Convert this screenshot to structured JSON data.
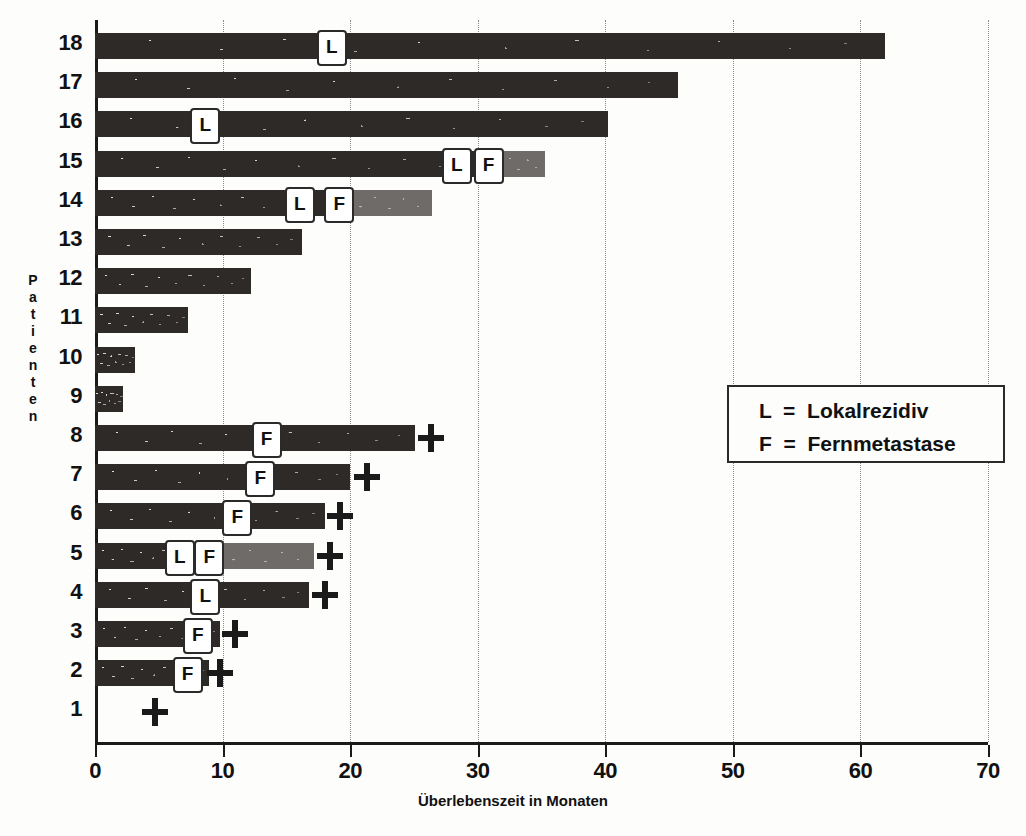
{
  "chart": {
    "type": "bar",
    "title": "",
    "xlabel": "Überlebenszeit in Monaten",
    "ylabel": "Patienten",
    "ylabel_letters": [
      "P",
      "a",
      "t",
      "i",
      "e",
      "n",
      "t",
      "e",
      "n"
    ],
    "xlim": [
      0,
      70
    ],
    "xticks": [
      0,
      10,
      20,
      30,
      40,
      50,
      60,
      70
    ],
    "xtick_labels": [
      "0",
      "10",
      "20",
      "30",
      "40",
      "50",
      "60",
      "70"
    ],
    "grid": "vertical-dotted",
    "legend": {
      "position": "right-middle",
      "entries": [
        {
          "key": "L",
          "equals": "=",
          "label": "Lokalrezidiv",
          "text": "L  =  Lokalrezidiv"
        },
        {
          "key": "F",
          "equals": "=",
          "label": "Fernmetastase",
          "text": "F  =  Fernmetastase"
        }
      ]
    },
    "marker_legend_note": "+ = Tod",
    "categories": [
      "18",
      "17",
      "16",
      "15",
      "14",
      "13",
      "12",
      "11",
      "10",
      "9",
      "8",
      "7",
      "6",
      "5",
      "4",
      "3",
      "2",
      "1"
    ]
  },
  "chart_data": {
    "type": "bar",
    "orientation": "horizontal",
    "title": "",
    "xlabel": "Überlebenszeit in Monaten",
    "ylabel": "Patienten",
    "xlim": [
      0,
      70
    ],
    "categories": [
      "18",
      "17",
      "16",
      "15",
      "14",
      "13",
      "12",
      "11",
      "10",
      "9",
      "8",
      "7",
      "6",
      "5",
      "4",
      "3",
      "2",
      "1"
    ],
    "values": [
      61.9,
      45.7,
      40.2,
      35.3,
      26.4,
      16.2,
      12.2,
      7.3,
      3.1,
      2.2,
      25.1,
      20.0,
      18.0,
      17.2,
      16.8,
      9.8,
      8.9,
      0.0
    ],
    "rows": [
      {
        "patient": "18",
        "label": "18",
        "total": 61.9,
        "dark_end": 61.9,
        "light_end": null,
        "death": null,
        "markers": [
          {
            "type": "L",
            "at": 18.4
          }
        ]
      },
      {
        "patient": "17",
        "label": "17",
        "total": 45.7,
        "dark_end": 45.7,
        "light_end": null,
        "death": null,
        "markers": []
      },
      {
        "patient": "16",
        "label": "16",
        "total": 40.2,
        "dark_end": 40.2,
        "light_end": null,
        "death": null,
        "markers": [
          {
            "type": "L",
            "at": 8.5
          }
        ]
      },
      {
        "patient": "15",
        "label": "15",
        "total": 35.3,
        "dark_end": 30.7,
        "light_end": 35.3,
        "death": null,
        "markers": [
          {
            "type": "L",
            "at": 28.2
          },
          {
            "type": "F",
            "at": 30.7
          }
        ]
      },
      {
        "patient": "14",
        "label": "14",
        "total": 26.4,
        "dark_end": 19.0,
        "light_end": 26.4,
        "death": null,
        "markers": [
          {
            "type": "L",
            "at": 15.9
          },
          {
            "type": "F",
            "at": 19.0
          }
        ]
      },
      {
        "patient": "13",
        "label": "13",
        "total": 16.2,
        "dark_end": 16.2,
        "light_end": null,
        "death": null,
        "markers": []
      },
      {
        "patient": "12",
        "label": "12",
        "total": 12.2,
        "dark_end": 12.2,
        "light_end": null,
        "death": null,
        "markers": []
      },
      {
        "patient": "11",
        "label": "11",
        "total": 7.3,
        "dark_end": 7.3,
        "light_end": null,
        "death": null,
        "markers": []
      },
      {
        "patient": "10",
        "label": "10",
        "total": 3.1,
        "dark_end": 3.1,
        "light_end": null,
        "death": null,
        "markers": []
      },
      {
        "patient": "9",
        "label": "9",
        "total": 2.2,
        "dark_end": 2.2,
        "light_end": null,
        "death": null,
        "markers": []
      },
      {
        "patient": "8",
        "label": "8",
        "total": 25.1,
        "dark_end": 25.1,
        "light_end": null,
        "death": 26.3,
        "markers": [
          {
            "type": "F",
            "at": 13.3
          }
        ]
      },
      {
        "patient": "7",
        "label": "7",
        "total": 20.0,
        "dark_end": 20.0,
        "light_end": null,
        "death": 21.3,
        "markers": [
          {
            "type": "F",
            "at": 12.8
          }
        ]
      },
      {
        "patient": "6",
        "label": "6",
        "total": 18.0,
        "dark_end": 18.0,
        "light_end": null,
        "death": 19.2,
        "markers": [
          {
            "type": "F",
            "at": 11.0
          }
        ]
      },
      {
        "patient": "5",
        "label": "5",
        "total": 17.2,
        "dark_end": 8.8,
        "light_end": 17.2,
        "death": 18.4,
        "markers": [
          {
            "type": "L",
            "at": 6.5
          },
          {
            "type": "F",
            "at": 8.8
          }
        ]
      },
      {
        "patient": "4",
        "label": "4",
        "total": 16.8,
        "dark_end": 16.8,
        "light_end": null,
        "death": 18.0,
        "markers": [
          {
            "type": "L",
            "at": 8.5
          }
        ]
      },
      {
        "patient": "3",
        "label": "3",
        "total": 9.8,
        "dark_end": 9.8,
        "light_end": null,
        "death": 11.0,
        "markers": [
          {
            "type": "F",
            "at": 7.9
          }
        ]
      },
      {
        "patient": "2",
        "label": "2",
        "total": 8.9,
        "dark_end": 8.9,
        "light_end": null,
        "death": 9.8,
        "markers": [
          {
            "type": "F",
            "at": 7.1
          }
        ]
      },
      {
        "patient": "1",
        "label": "1",
        "total": 0.0,
        "dark_end": 0.0,
        "light_end": null,
        "death": 4.7,
        "markers": []
      }
    ],
    "series": [
      {
        "name": "Überleben ohne Rezidiv (dunkel)",
        "values": [
          61.9,
          45.7,
          40.2,
          30.7,
          19.0,
          16.2,
          12.2,
          7.3,
          3.1,
          2.2,
          25.1,
          20.0,
          18.0,
          8.8,
          16.8,
          9.8,
          8.9,
          0.0
        ]
      },
      {
        "name": "Überleben nach Fernmetastase (hell)",
        "values": [
          0,
          0,
          0,
          4.6,
          7.4,
          0,
          0,
          0,
          0,
          0,
          0,
          0,
          0,
          8.4,
          0,
          0,
          0,
          0
        ]
      }
    ],
    "annotations": {
      "L": "Lokalrezidiv",
      "F": "Fernmetastase",
      "+": "Tod"
    },
    "colors": {
      "bar_dark": "#2d2a28",
      "bar_light": "#6f6b68",
      "axis": "#1a1a1a",
      "grid": "#8a8a8a",
      "background": "#fdfdfb",
      "marker_box": "#ffffff"
    }
  }
}
